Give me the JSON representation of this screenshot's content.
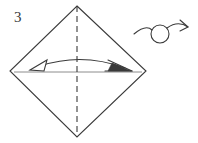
{
  "figure": {
    "kind": "origami-instruction-diagram",
    "step_number": "3",
    "background_color": "#ffffff",
    "line_color": "#3a3a3a",
    "thin_line_color": "#6e6e6e",
    "width": 198,
    "height": 143
  },
  "shape": {
    "name": "square-rotated-diamond",
    "vertices": {
      "top": {
        "x": 77,
        "y": 6
      },
      "right": {
        "x": 146,
        "y": 71
      },
      "bottom": {
        "x": 77,
        "y": 137
      },
      "left": {
        "x": 10,
        "y": 71
      }
    },
    "stroke_width": 1.1
  },
  "fold_line": {
    "name": "vertical-valley-fold-line",
    "style": "dashed",
    "x": 77,
    "y_start": 6,
    "y_end": 137,
    "dash_pattern": "6,4"
  },
  "horizontal_diagonal": {
    "name": "horizontal-diagonal-line",
    "style": "solid-thin",
    "y": 72,
    "x_start": 14,
    "x_end": 142
  },
  "fold_arrow": {
    "name": "fold-and-unfold-arrow",
    "description": "Curved double-headed arrow spanning the square horizontally",
    "arc_start": {
      "x": 38,
      "y": 65
    },
    "arc_end": {
      "x": 126,
      "y": 68
    },
    "arc_peak_y": 58,
    "left_head": {
      "type": "hollow-triangle",
      "label": "unfold"
    },
    "right_head": {
      "type": "open-barbed-arrow",
      "label": "fold"
    }
  },
  "turn_over_symbol": {
    "name": "turn-over-symbol",
    "description": "Loop arrow meaning turn the model over",
    "circle_center": {
      "x": 160,
      "y": 34
    },
    "circle_radius": 9,
    "tail_start": {
      "x": 134,
      "y": 33
    },
    "arrow_tip": {
      "x": 189,
      "y": 27
    }
  },
  "labels": {
    "step_label": "3",
    "step_label_position": {
      "x": 14,
      "y": 22
    }
  }
}
